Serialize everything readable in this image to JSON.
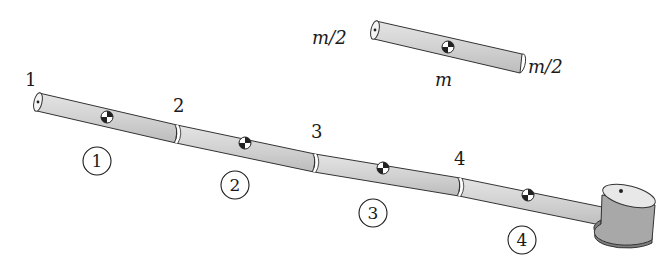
{
  "diagram": {
    "colors": {
      "rod_fill": "#d6d6d6",
      "rod_fill_dark": "#bdbdbd",
      "outline": "#333333",
      "cylinder_top": "#e6e6e6",
      "cylinder_side": "#a8a8a8",
      "cylinder_bottom": "#7d7d7d",
      "text": "#1a1a1a"
    },
    "node_labels": [
      "1",
      "2",
      "3",
      "4"
    ],
    "segment_labels": [
      "1",
      "2",
      "3",
      "4"
    ],
    "inset": {
      "left_mass_label": "m/2",
      "right_mass_label": "m/2",
      "center_mass_label": "m"
    }
  }
}
